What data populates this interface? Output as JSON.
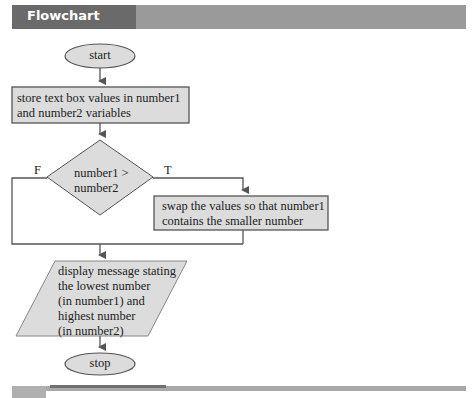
{
  "header": {
    "title": "Flowchart"
  },
  "colors": {
    "shape_fill": "#dcdcdc",
    "stroke": "#555555",
    "header_dark": "#6a6a6a",
    "header_light": "#9a9a9a"
  },
  "nodes": {
    "start": {
      "type": "terminator",
      "label": "start"
    },
    "store": {
      "type": "process",
      "label_lines": [
        "store text box values in number1",
        "and number2 variables"
      ]
    },
    "decision": {
      "type": "decision",
      "label_lines": [
        "number1 >",
        "number2"
      ],
      "false_label": "F",
      "true_label": "T"
    },
    "swap": {
      "type": "process",
      "label_lines": [
        "swap the values so that number1",
        "contains the smaller number"
      ]
    },
    "display": {
      "type": "io",
      "label_lines": [
        "display message stating",
        "the lowest number",
        "(in number1) and",
        "highest number",
        "(in number2)"
      ]
    },
    "stop": {
      "type": "terminator",
      "label": "stop"
    }
  }
}
